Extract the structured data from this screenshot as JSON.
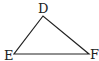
{
  "diagram": {
    "type": "triangle",
    "stroke_color": "#222222",
    "vertices": [
      {
        "name": "D",
        "x": 43,
        "y": 16,
        "label_x": 38,
        "label_y": 13
      },
      {
        "name": "E",
        "x": 14,
        "y": 54,
        "label_x": 4,
        "label_y": 60
      },
      {
        "name": "F",
        "x": 89,
        "y": 54,
        "label_x": 90,
        "label_y": 59
      }
    ]
  }
}
